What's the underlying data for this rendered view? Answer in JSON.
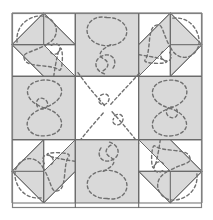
{
  "figure": {
    "name": "quilt-block-diagram",
    "canvas": {
      "width": 213,
      "height": 220,
      "background": "#ffffff"
    },
    "quilt": {
      "x": 12,
      "y": 13,
      "width": 190,
      "height": 195,
      "grid_units": 6,
      "unit_size": 31.7
    },
    "colors": {
      "background": "#ffffff",
      "patch_light": "#ffffff",
      "patch_shaded": "#d9d9d9",
      "patch_shaded_alt": "#d3d3d3",
      "seam_line": "#6b6b6b",
      "outer_border": "#808080",
      "stitch_dash": "#707070"
    },
    "line_weights": {
      "outer_border": 1.2,
      "seam": 1.1,
      "patch_edge": 1.0,
      "stitch": 1.4
    },
    "stitch_style": {
      "pattern": "dashed",
      "dash_array": "3,2.6",
      "cap": "round"
    }
  },
  "blocks": [
    {
      "name": "block-top-left",
      "position": "top-left",
      "col": 0,
      "row": 0,
      "span_cols": 2,
      "span_rows": 2,
      "rotation_deg": 0,
      "patches": [
        "half-square-triangle",
        "diagonal-bar",
        "corner-triangle"
      ],
      "shaded": true,
      "quilting_motif": "loop-and-curve"
    },
    {
      "name": "block-top-center",
      "position": "top-center",
      "col": 2,
      "row": 0,
      "span_cols": 2,
      "span_rows": 2,
      "rotation_deg": 0,
      "patches": [
        "plain-rectangle"
      ],
      "shaded": true,
      "quilting_motif": "balloon-loop"
    },
    {
      "name": "block-top-right",
      "position": "top-right",
      "col": 4,
      "row": 0,
      "span_cols": 2,
      "span_rows": 2,
      "rotation_deg": 90,
      "patches": [
        "half-square-triangle",
        "diagonal-bar",
        "corner-triangle"
      ],
      "shaded": true,
      "quilting_motif": "loop-and-curve"
    },
    {
      "name": "block-middle-left",
      "position": "middle-left",
      "col": 0,
      "row": 2,
      "span_cols": 2,
      "span_rows": 2,
      "rotation_deg": 270,
      "patches": [
        "plain-rectangle"
      ],
      "shaded": true,
      "quilting_motif": "figure-eight"
    },
    {
      "name": "block-center",
      "position": "center",
      "col": 2,
      "row": 2,
      "span_cols": 2,
      "span_rows": 2,
      "rotation_deg": 0,
      "patches": [
        "plain-square"
      ],
      "shaded": false,
      "quilting_motif": "radiating-diagonals"
    },
    {
      "name": "block-middle-right",
      "position": "middle-right",
      "col": 4,
      "row": 2,
      "span_cols": 2,
      "span_rows": 2,
      "rotation_deg": 90,
      "patches": [
        "plain-rectangle"
      ],
      "shaded": true,
      "quilting_motif": "figure-eight"
    },
    {
      "name": "block-bottom-left",
      "position": "bottom-left",
      "col": 0,
      "row": 4,
      "span_cols": 2,
      "span_rows": 2,
      "rotation_deg": 270,
      "patches": [
        "half-square-triangle",
        "diagonal-bar",
        "corner-triangle"
      ],
      "shaded": true,
      "quilting_motif": "loop-and-curve"
    },
    {
      "name": "block-bottom-center",
      "position": "bottom-center",
      "col": 2,
      "row": 4,
      "span_cols": 2,
      "span_rows": 2,
      "rotation_deg": 180,
      "patches": [
        "plain-rectangle"
      ],
      "shaded": true,
      "quilting_motif": "balloon-loop"
    },
    {
      "name": "block-bottom-right",
      "position": "bottom-right",
      "col": 4,
      "row": 4,
      "span_cols": 2,
      "span_rows": 2,
      "rotation_deg": 180,
      "patches": [
        "half-square-triangle",
        "diagonal-bar",
        "corner-triangle"
      ],
      "shaded": true,
      "quilting_motif": "loop-and-curve"
    }
  ]
}
